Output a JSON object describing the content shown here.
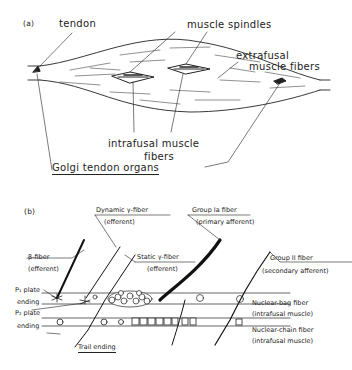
{
  "panel_a": {
    "panel_label": "(a)",
    "tendon": "tendon",
    "muscle_spindles": "muscle spindles",
    "extrafusal_line1": "extrafusal",
    "extrafusal_line2": "muscle fibers",
    "intrafusal_line1": "intrafusal muscle",
    "intrafusal_line2": "fibers",
    "golgi": "Golgi tendon organs"
  },
  "panel_b": {
    "panel_label": "(b)",
    "dynamic_gamma": "Dynamic γ-fiber",
    "dynamic_gamma_sub": "(efferent)",
    "group_ia": "Group Ia fiber",
    "group_ia_sub": "(primary afferent)",
    "beta": "β-fiber",
    "beta_sub": "(efferent)",
    "static_gamma": "Static γ-fiber",
    "static_gamma_sub": "(efferent)",
    "group_ii": "Group II fiber",
    "group_ii_sub": "(secondary afferent)",
    "p1_line1": "P₁ plate",
    "p1_line2": "ending",
    "p2_line1": "P₂ plate",
    "p2_line2": "ending",
    "trail": "Trail ending",
    "nuclear_bag": "Nuclear-bag fiber",
    "nuclear_bag_sub": "(intrafusal muscle)",
    "nuclear_chain": "Nuclear-chain fiber",
    "nuclear_chain_sub": "(intrafusal muscle)"
  }
}
